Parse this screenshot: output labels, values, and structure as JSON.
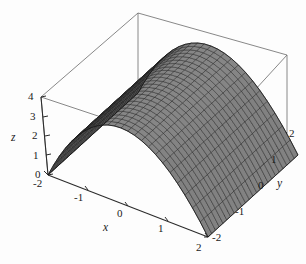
{
  "chart_data": {
    "type": "surface",
    "title": "",
    "subtitle": "",
    "function": "z = 4 - x^2",
    "xlabel": "x",
    "ylabel": "y",
    "zlabel": "z",
    "xlim": [
      -2,
      2
    ],
    "ylim": [
      -2,
      2
    ],
    "zlim": [
      0,
      4
    ],
    "x_ticks": [
      "-2",
      "-1",
      "0",
      "1",
      "2"
    ],
    "x_tick_values": [
      -2,
      -1,
      0,
      1,
      2
    ],
    "y_ticks": [
      "2",
      "1",
      "0",
      "-1",
      "-2"
    ],
    "y_tick_values": [
      2,
      1,
      0,
      -1,
      -2
    ],
    "z_ticks": [
      "0",
      "1",
      "2",
      "3",
      "4"
    ],
    "z_tick_values": [
      0,
      1,
      2,
      3,
      4
    ],
    "grid": false,
    "legend": "none",
    "mesh": true,
    "mesh_divisions_x": 24,
    "mesh_divisions_y": 24,
    "surface_color": "#8c8c8c",
    "surface_color_dark": "#5a5a5a",
    "mesh_color": "#1c1c1c",
    "axis_color": "#2b2b2b",
    "box_color": "#555555",
    "background": "#ffffff",
    "x_samples": [
      -2,
      -1.75,
      -1.5,
      -1.25,
      -1,
      -0.75,
      -0.5,
      -0.25,
      0,
      0.25,
      0.5,
      0.75,
      1,
      1.25,
      1.5,
      1.75,
      2
    ],
    "z_profile": [
      0,
      0.9375,
      1.75,
      2.4375,
      3,
      3.4375,
      3.75,
      3.9375,
      4,
      3.9375,
      3.75,
      3.4375,
      3,
      2.4375,
      1.75,
      0.9375,
      0
    ]
  },
  "labels": {
    "x_axis": "x",
    "y_axis": "y",
    "z_axis": "z"
  }
}
